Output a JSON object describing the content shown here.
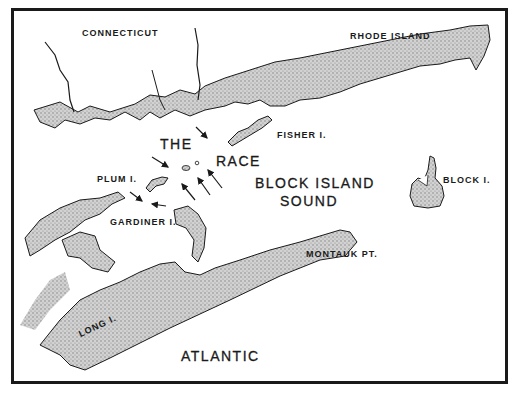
{
  "map": {
    "labels": {
      "connecticut": "CONNECTICUT",
      "rhode_island": "RHODE ISLAND",
      "fisher": "FISHER I.",
      "the": "THE",
      "race": "RACE",
      "plum": "PLUM I.",
      "block_island_sound_1": "BLOCK ISLAND",
      "block_island_sound_2": "SOUND",
      "block": "BLOCK I.",
      "gardiner": "GARDINER I.",
      "montauk": "MONTAUK PT.",
      "long": "LONG I.",
      "atlantic": "ATLANTIC"
    },
    "colors": {
      "ink": "#1a1a1a",
      "land": "#b8b8b8",
      "water": "#ffffff"
    },
    "arrow_count": 7
  }
}
